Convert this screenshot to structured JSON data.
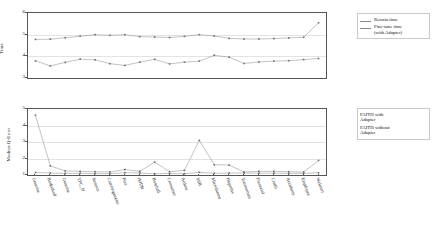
{
  "chart_data": [
    {
      "type": "line",
      "id": "training-time-chart",
      "title": "",
      "xlabel": "",
      "ylabel": "Time",
      "ylim": [
        3,
        6
      ],
      "yticks": [
        3,
        4,
        5,
        6
      ],
      "grid": true,
      "legend_position": "right",
      "categories": [
        "Genome",
        "Basketball",
        "Genome",
        "TPC_H",
        "Sensors",
        "Carcinogenesis",
        "Pisa",
        "IMDB",
        "Baseball",
        "Consumer",
        "Airline",
        "SSB",
        "Microbiome",
        "Hepatitis",
        "Tournament",
        "Financial",
        "Credit",
        "Accidents",
        "Employee",
        "Walmart"
      ],
      "series": [
        {
          "name": "Retrain time",
          "values": [
            4.78,
            4.79,
            4.86,
            4.93,
            5.0,
            4.97,
            5.0,
            4.91,
            4.89,
            4.87,
            4.92,
            5.0,
            4.94,
            4.83,
            4.8,
            4.8,
            4.82,
            4.85,
            4.88,
            5.55
          ]
        },
        {
          "name": "Fine-tune time (with Adapter)",
          "values": [
            3.79,
            3.56,
            3.72,
            3.87,
            3.84,
            3.66,
            3.58,
            3.73,
            3.86,
            3.65,
            3.73,
            3.78,
            4.05,
            3.96,
            3.67,
            3.74,
            3.78,
            3.8,
            3.85,
            3.9
          ]
        }
      ]
    },
    {
      "type": "line",
      "id": "median-q-error-chart",
      "title": "",
      "xlabel": "",
      "ylabel": "Median Q-Error",
      "ylim": [
        1,
        5
      ],
      "yticks": [
        1,
        2,
        3,
        4,
        5
      ],
      "grid": true,
      "legend_position": "right",
      "categories": [
        "Genome",
        "Basketball",
        "Genome",
        "TPC_H",
        "Sensors",
        "Carcinogenesis",
        "Pisa",
        "IMDB",
        "Baseball",
        "Consumer",
        "Airline",
        "SSB",
        "Microbiome",
        "Hepatitis",
        "Tournament",
        "Financial",
        "Credit",
        "Accidents",
        "Employee",
        "Walmart"
      ],
      "series": [
        {
          "name": "FAITH with Adapter",
          "values": [
            1.15,
            1.12,
            1.1,
            1.1,
            1.09,
            1.08,
            1.14,
            1.12,
            1.08,
            1.09,
            1.08,
            1.16,
            1.1,
            1.12,
            1.12,
            1.11,
            1.11,
            1.1,
            1.1,
            1.14
          ]
        },
        {
          "name": "FAITH without Adapter",
          "values": [
            4.62,
            1.55,
            1.25,
            1.22,
            1.2,
            1.18,
            1.33,
            1.22,
            1.78,
            1.2,
            1.28,
            3.1,
            1.62,
            1.6,
            1.18,
            1.22,
            1.22,
            1.2,
            1.18,
            1.88
          ]
        }
      ]
    }
  ],
  "top_chart": {
    "ylabel": "Time",
    "yticks": [
      "3",
      "4",
      "5",
      "6"
    ],
    "legend": [
      {
        "label": "Retrain time"
      },
      {
        "label": "Fine-tune time\n(with Adapter)"
      }
    ]
  },
  "bottom_chart": {
    "ylabel": "Median Q-Error",
    "yticks": [
      "1",
      "2",
      "3",
      "4",
      "5"
    ],
    "legend": [
      {
        "label": "FAITH with\nAdapter"
      },
      {
        "label": "FAITH without\nAdapter"
      }
    ],
    "xlabels": [
      "Genome",
      "Basketball",
      "Genome",
      "TPC_H",
      "Sensors",
      "Carcinogenesis",
      "Pisa",
      "IMDB",
      "Baseball",
      "Consumer",
      "Airline",
      "SSB",
      "Microbiome",
      "Hepatitis",
      "Tournament",
      "Financial",
      "Credit",
      "Accidents",
      "Employee",
      "Walmart"
    ]
  },
  "colors": {
    "axis": "#555555",
    "grid": "#e3e3e3",
    "series_a": "#9a9a9a",
    "series_b": "#9a9a9a",
    "text": "#111111"
  }
}
